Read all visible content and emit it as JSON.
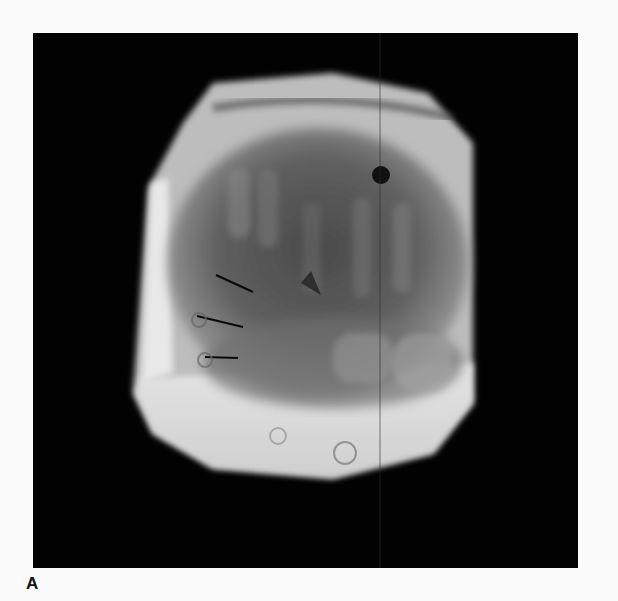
{
  "figure": {
    "panel_label": "A",
    "image_description": "Radiograph (X-ray) of a cylindrical/octagonal specimen showing a hand/foot-like skeletal structure with three black marker lines on the left side",
    "background_color": "#020202",
    "page_background": "#fbfbfb"
  }
}
